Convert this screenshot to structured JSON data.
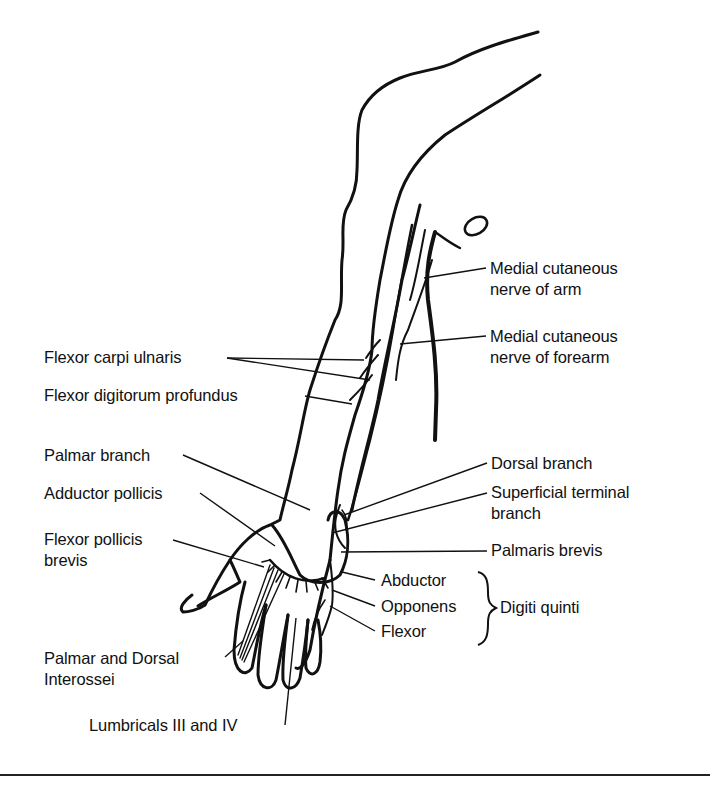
{
  "figure": {
    "stroke_color": "#111111",
    "background": "#ffffff"
  },
  "labels": {
    "right": {
      "medial_cutaneous_arm": [
        "Medial cutaneous",
        "nerve of arm"
      ],
      "medial_cutaneous_forearm": [
        "Medial cutaneous",
        "nerve of forearm"
      ],
      "dorsal_branch": "Dorsal branch",
      "superficial_terminal_branch": [
        "Superficial terminal",
        "branch"
      ],
      "palmaris_brevis": "Palmaris brevis",
      "digiti_quinti_group": {
        "items": [
          "Abductor",
          "Opponens",
          "Flexor"
        ],
        "group_label": "Digiti quinti"
      }
    },
    "left": {
      "flexor_carpi_ulnaris": "Flexor carpi ulnaris",
      "flexor_digitorum_profundus": "Flexor digitorum profundus",
      "palmar_branch": "Palmar branch",
      "adductor_pollicis": "Adductor pollicis",
      "flexor_pollicis_brevis": [
        "Flexor pollicis",
        "brevis"
      ],
      "interossei": [
        "Palmar and Dorsal",
        "Interossei"
      ]
    },
    "bottom": {
      "lumbricals": "Lumbricals III and IV"
    }
  }
}
